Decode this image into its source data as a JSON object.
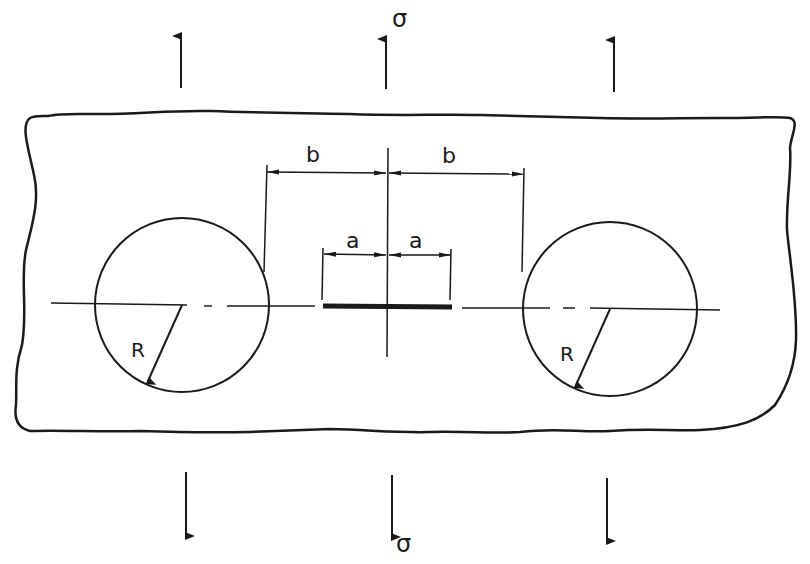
{
  "figure": {
    "colors": {
      "ink": "#1a1a1a",
      "background": "#ffffff"
    }
  },
  "labels": {
    "stress_top": "σ",
    "stress_bottom": "σ",
    "half_spacing_left": "b",
    "half_spacing_right": "b",
    "half_crack_left": "a",
    "half_crack_right": "a",
    "radius_left": "R",
    "radius_right": "R"
  },
  "elements": {
    "load_arrows_top": 3,
    "load_arrows_bottom": 3,
    "holes": 2,
    "crack": 1
  }
}
